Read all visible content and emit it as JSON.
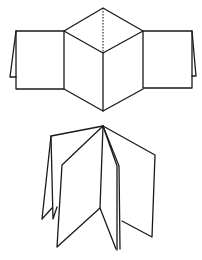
{
  "figures": [
    {
      "id": "unfolded-net",
      "description": "Unfolded accordion book net with central cube-like fold and two side panels with flaps",
      "stroke_color": "#1a1a1a",
      "polylines": [
        "16,31 64,31 64,89 16,89 16,31",
        "16,31 10,77 16,77",
        "64,31 103,8 143,31 103,53 64,31",
        "64,89 103,111 143,89",
        "103,53 103,111",
        "143,31 192,31 192,88 143,88 143,31",
        "192,31 196,76 192,76"
      ],
      "dashed": [
        "103,8 103,53"
      ]
    },
    {
      "id": "folded-book",
      "description": "Folded accordion book standing open with multiple pages fanned from a common spine",
      "stroke_color": "#1a1a1a",
      "polylines": [
        "103,126 51,136 42,219 52,208",
        "51,136 53,219 57,207",
        "103,126 62,165 57,247 100,208 103,126",
        "103,126 119,166 120,249",
        "100,208 116,249",
        "103,126 117,166 117,250",
        "103,126 155,155 152,237 122,221"
      ],
      "dashed": []
    }
  ]
}
